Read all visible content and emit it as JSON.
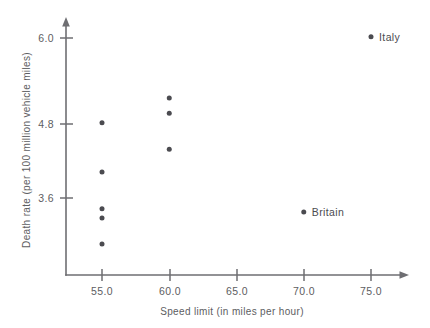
{
  "chart_data": {
    "type": "scatter",
    "title": "",
    "xlabel": "Speed limit (in miles per hour)",
    "ylabel": "Death rate (per 100 million vehicle miles)",
    "xlim": [
      52.0,
      77.0
    ],
    "ylim": [
      2.4,
      6.3
    ],
    "grid": false,
    "legend": "none",
    "xticks": [
      55.0,
      60.0,
      65.0,
      70.0,
      75.0
    ],
    "xtick_labels": [
      "55.0",
      "60.0",
      "65.0",
      "70.0",
      "75.0"
    ],
    "yticks": [
      3.6,
      4.8,
      6.0
    ],
    "ytick_labels": [
      "3.6",
      "4.8",
      "6.0"
    ],
    "points": [
      {
        "x": 55.0,
        "y": 4.73,
        "label": ""
      },
      {
        "x": 55.0,
        "y": 3.99,
        "label": ""
      },
      {
        "x": 55.0,
        "y": 3.44,
        "label": ""
      },
      {
        "x": 55.0,
        "y": 3.3,
        "label": ""
      },
      {
        "x": 55.0,
        "y": 2.91,
        "label": ""
      },
      {
        "x": 60.0,
        "y": 5.1,
        "label": ""
      },
      {
        "x": 60.0,
        "y": 4.87,
        "label": ""
      },
      {
        "x": 60.0,
        "y": 4.33,
        "label": ""
      },
      {
        "x": 70.0,
        "y": 3.39,
        "label": "Britain"
      },
      {
        "x": 75.0,
        "y": 6.02,
        "label": "Italy"
      }
    ],
    "colors": {
      "point": "#4b4b50",
      "axis": "#6e6e72",
      "text": "#5d5d61",
      "background": "#ffffff"
    }
  }
}
